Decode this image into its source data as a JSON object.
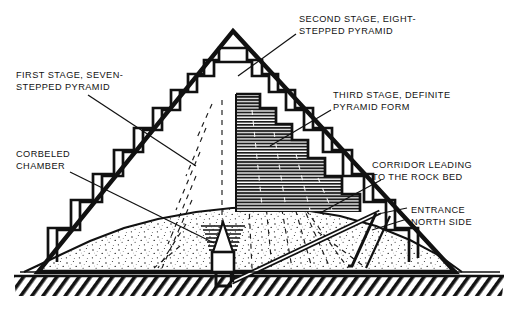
{
  "figure": {
    "background_color": "#ffffff",
    "ink_color": "#111111",
    "core_fill_color": "#6f6f6f",
    "sand_fill_color": "#ffffff",
    "bedrock_color": "#1a1a1a",
    "width": 516,
    "height": 317
  },
  "annotations": [
    {
      "id": "second-stage",
      "line1": "SECOND STAGE, EIGHT-",
      "line2": "STEPPED PYRAMID",
      "x": 299,
      "y": 14,
      "align": "left"
    },
    {
      "id": "first-stage",
      "line1": "FIRST STAGE, SEVEN-",
      "line2": "STEPPED PYRAMID",
      "x": 16,
      "y": 70,
      "align": "left"
    },
    {
      "id": "third-stage",
      "line1": "THIRD STAGE, DEFINITE",
      "line2": "PYRAMID FORM",
      "x": 333,
      "y": 90,
      "align": "left"
    },
    {
      "id": "corbeled-chamber",
      "line1": "CORBELED",
      "line2": "CHAMBER",
      "x": 16,
      "y": 149,
      "align": "left"
    },
    {
      "id": "corridor",
      "line1": "CORRIDOR LEADING",
      "line2": "TO THE ROCK BED",
      "x": 372,
      "y": 160,
      "align": "left"
    },
    {
      "id": "entrance",
      "line1": "ENTRANCE",
      "line2": "NORTH SIDE",
      "x": 411,
      "y": 205,
      "align": "left"
    }
  ],
  "leader_lines": [
    {
      "id": "leader-second-stage",
      "points": "296,34 238,76"
    },
    {
      "id": "leader-first-stage",
      "points": "88,95 196,166"
    },
    {
      "id": "leader-third-stage",
      "points": "331,110 270,146"
    },
    {
      "id": "leader-corbeled-chamber",
      "points": "70,172 214,243"
    },
    {
      "id": "leader-corridor",
      "points": "381,180 320,213"
    },
    {
      "id": "leader-entrance-upper",
      "points": "407,208 378,214"
    },
    {
      "id": "leader-entrance-lower",
      "points": "407,219 372,230"
    }
  ],
  "structure": {
    "outer_pyramid_apex": {
      "x": 233,
      "y": 31
    },
    "outer_pyramid_base_left": {
      "x": 38,
      "y": 272
    },
    "outer_pyramid_base_right": {
      "x": 455,
      "y": 272
    },
    "ground_line_y": 272,
    "bedrock_top_y": 274,
    "bedrock_bottom_y": 297,
    "stage_labels": [
      "first stage",
      "second stage",
      "third stage"
    ],
    "step_count_first_stage": 7,
    "step_count_second_stage": 8
  }
}
